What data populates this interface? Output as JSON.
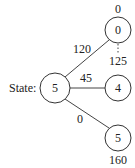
{
  "diagram": {
    "state_label": "State:",
    "root": {
      "value": "5"
    },
    "children": [
      {
        "value": "0",
        "edge_label": "120",
        "top_label": "0",
        "bottom_label": "125"
      },
      {
        "value": "4",
        "edge_label": "45"
      },
      {
        "value": "5",
        "edge_label": "0",
        "bottom_label": "160"
      }
    ]
  }
}
